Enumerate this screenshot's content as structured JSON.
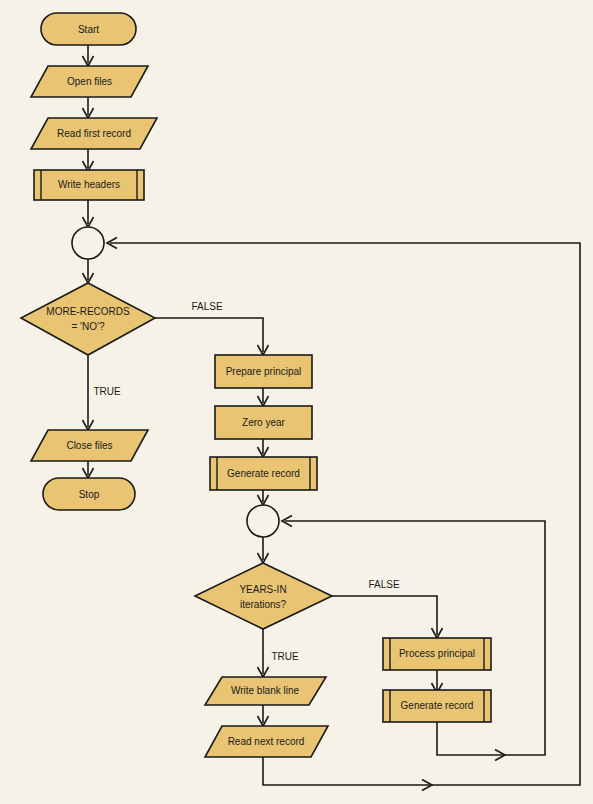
{
  "diagram": {
    "background_color": "#f6f2e7",
    "shape_fill_color": "#e9c473",
    "stroke_color": "#1a1a1a",
    "nodes": {
      "start": {
        "label": "Start",
        "type": "terminator"
      },
      "open_files": {
        "label": "Open files",
        "type": "input-output"
      },
      "read_first_record": {
        "label": "Read first record",
        "type": "input-output"
      },
      "write_headers": {
        "label": "Write headers",
        "type": "predefined-process"
      },
      "connector_1": {
        "label": "",
        "type": "connector"
      },
      "more_records": {
        "label_line1": "MORE-RECORDS",
        "label_line2": "= 'NO'?",
        "type": "decision"
      },
      "close_files": {
        "label": "Close files",
        "type": "input-output"
      },
      "stop": {
        "label": "Stop",
        "type": "terminator"
      },
      "prepare_principal": {
        "label": "Prepare principal",
        "type": "process"
      },
      "zero_year": {
        "label": "Zero year",
        "type": "process"
      },
      "generate_record_1": {
        "label": "Generate record",
        "type": "predefined-process"
      },
      "connector_2": {
        "label": "",
        "type": "connector"
      },
      "years_in": {
        "label_line1": "YEARS-IN",
        "label_line2": "iterations?",
        "type": "decision"
      },
      "write_blank_line": {
        "label": "Write blank line",
        "type": "input-output"
      },
      "read_next_record": {
        "label": "Read next record",
        "type": "input-output"
      },
      "process_principal": {
        "label": "Process principal",
        "type": "predefined-process"
      },
      "generate_record_2": {
        "label": "Generate record",
        "type": "predefined-process"
      }
    },
    "edge_labels": {
      "more_records_false": "FALSE",
      "more_records_true": "TRUE",
      "years_in_false": "FALSE",
      "years_in_true": "TRUE"
    }
  }
}
